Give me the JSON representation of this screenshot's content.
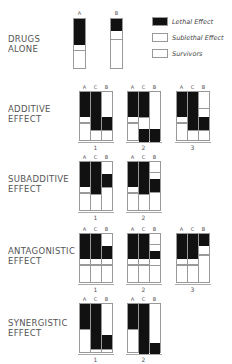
{
  "legend": [
    {
      "label": "Lethal Effect",
      "fill": "#111111"
    },
    {
      "label": "Sublethal Effect",
      "fill": "#ffffff"
    },
    {
      "label": "Survivors",
      "fill": "#ffffff"
    }
  ],
  "drugs_alone": {
    "label_line1": "DRUGS",
    "label_line2": "ALONE",
    "bars": [
      {
        "name": "A",
        "lethal": 0.51,
        "sublethal": 0.12
      },
      {
        "name": "B",
        "lethal": 0.24,
        "sublethal": 0.17
      }
    ]
  },
  "rows": [
    {
      "label_line1": "ADDITIVE",
      "label_line2": "EFFECT",
      "panels": [
        {
          "num": "1",
          "cols": [
            {
              "name": "A",
              "lethal_top": 0,
              "lethal_h": 0.5,
              "sub_h": 0.12
            },
            {
              "name": "C",
              "lethal_top": 0,
              "lethal_h": 0.76,
              "sub_h": 0.0
            },
            {
              "name": "B",
              "lethal_top": 0.5,
              "lethal_h": 0.26,
              "sub_h": 0.0
            }
          ]
        },
        {
          "num": "2",
          "cols": [
            {
              "name": "A",
              "lethal_top": 0,
              "lethal_h": 0.5,
              "sub_h": 0.12
            },
            {
              "name": "C",
              "lethal_top": 0,
              "lethal_h": 0.5,
              "sub_h": 0.0,
              "lethal2_top": 0.74,
              "lethal2_h": 0.26
            },
            {
              "name": "B",
              "lethal_top": 0.74,
              "lethal_h": 0.26,
              "sub_h": 0.0
            }
          ]
        },
        {
          "num": "3",
          "cols": [
            {
              "name": "A",
              "lethal_top": 0,
              "lethal_h": 0.5,
              "sub_h": 0.12
            },
            {
              "name": "C",
              "lethal_top": 0,
              "lethal_h": 0.76,
              "sub_h": 0.0
            },
            {
              "name": "B",
              "lethal_top": 0.5,
              "lethal_h": 0.26,
              "sub_h": 0.0,
              "sub_top": 0.32
            }
          ]
        }
      ]
    },
    {
      "label_line1": "SUBADDITIVE",
      "label_line2": "EFFECT",
      "panels": [
        {
          "num": "1",
          "cols": [
            {
              "name": "A",
              "lethal_top": 0,
              "lethal_h": 0.5,
              "sub_h": 0.12
            },
            {
              "name": "C",
              "lethal_top": 0,
              "lethal_h": 0.64,
              "sub_h": 0.0
            },
            {
              "name": "B",
              "lethal_top": 0.24,
              "lethal_h": 0.26,
              "sub_h": 0.0
            }
          ]
        },
        {
          "num": "2",
          "cols": [
            {
              "name": "A",
              "lethal_top": 0,
              "lethal_h": 0.5,
              "sub_h": 0.12
            },
            {
              "name": "C",
              "lethal_top": 0,
              "lethal_h": 0.64,
              "sub_h": 0.0
            },
            {
              "name": "B",
              "lethal_top": 0.34,
              "lethal_h": 0.26,
              "sub_h": 0.0,
              "sub_top": 0.2
            }
          ]
        }
      ]
    },
    {
      "label_line1": "ANTAGONISTIC",
      "label_line2": "EFFECT",
      "panels": [
        {
          "num": "1",
          "cols": [
            {
              "name": "A",
              "lethal_top": 0,
              "lethal_h": 0.5,
              "sub_h": 0.12
            },
            {
              "name": "C",
              "lethal_top": 0,
              "lethal_h": 0.5,
              "sub_h": 0.12
            },
            {
              "name": "B",
              "lethal_top": 0.24,
              "lethal_h": 0.26,
              "sub_h": 0.12
            }
          ]
        },
        {
          "num": "2",
          "cols": [
            {
              "name": "A",
              "lethal_top": 0,
              "lethal_h": 0.5,
              "sub_h": 0.12
            },
            {
              "name": "C",
              "lethal_top": 0,
              "lethal_h": 0.5,
              "sub_h": 0.12
            },
            {
              "name": "B",
              "lethal_top": 0.34,
              "lethal_h": 0.16,
              "sub_h": 0.12,
              "sub_top": 0.2
            }
          ]
        },
        {
          "num": "3",
          "cols": [
            {
              "name": "A",
              "lethal_top": 0,
              "lethal_h": 0.5,
              "sub_h": 0.12
            },
            {
              "name": "C",
              "lethal_top": 0,
              "lethal_h": 0.5,
              "sub_h": 0.12
            },
            {
              "name": "B",
              "lethal_top": 0,
              "lethal_h": 0.24,
              "sub_h": 0.17
            }
          ]
        }
      ]
    },
    {
      "label_line1": "SYNERGISTIC",
      "label_line2": "EFFECT",
      "panels": [
        {
          "num": "1",
          "cols": [
            {
              "name": "A",
              "lethal_top": 0,
              "lethal_h": 0.5,
              "sub_h": 0.0
            },
            {
              "name": "C",
              "lethal_top": 0,
              "lethal_h": 0.9,
              "sub_h": 0.0
            },
            {
              "name": "B",
              "lethal_top": 0.62,
              "lethal_h": 0.28,
              "sub_h": 0.0
            }
          ]
        },
        {
          "num": "2",
          "cols": [
            {
              "name": "A",
              "lethal_top": 0,
              "lethal_h": 0.5,
              "sub_h": 0.0
            },
            {
              "name": "C",
              "lethal_top": 0,
              "lethal_h": 1.0,
              "sub_h": 0.0
            },
            {
              "name": "B",
              "lethal_top": 0.78,
              "lethal_h": 0.22,
              "sub_h": 0.0
            }
          ]
        }
      ]
    }
  ]
}
